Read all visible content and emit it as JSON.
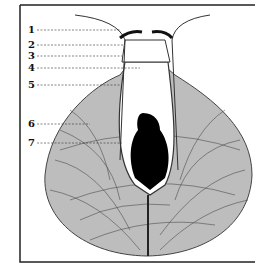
{
  "figure": {
    "type": "anatomical-line-drawing",
    "labels": [
      {
        "id": "1",
        "text": "1",
        "y": 30,
        "tx": 120
      },
      {
        "id": "2",
        "text": "2",
        "y": 45,
        "tx": 124
      },
      {
        "id": "3",
        "text": "3",
        "y": 56,
        "tx": 122
      },
      {
        "id": "4",
        "text": "4",
        "y": 68,
        "tx": 140
      },
      {
        "id": "5",
        "text": "5",
        "y": 85,
        "tx": 122
      },
      {
        "id": "6",
        "text": "6",
        "y": 124,
        "tx": 90
      },
      {
        "id": "7",
        "text": "7",
        "y": 143,
        "tx": 122
      }
    ],
    "colors": {
      "fill": "#bdbdbd",
      "ink": "#111111",
      "frame": "#222222"
    }
  }
}
